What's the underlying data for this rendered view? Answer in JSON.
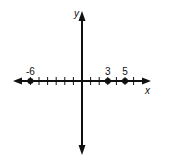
{
  "diagram": {
    "type": "number_line_on_coordinate_axes",
    "x_axis_label": "x",
    "y_axis_label": "y",
    "tick_range": [
      -6,
      6
    ],
    "points": [
      {
        "value": -6,
        "label": "-6"
      },
      {
        "value": 3,
        "label": "3"
      },
      {
        "value": 5,
        "label": "5"
      }
    ],
    "colors": {
      "ink": "#111111",
      "background": "#ffffff"
    }
  }
}
